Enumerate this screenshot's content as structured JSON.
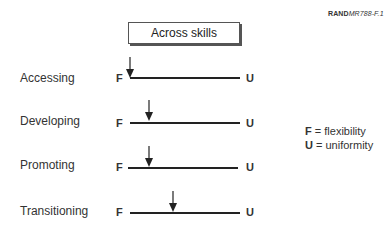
{
  "figure_id": {
    "prefix": "RAND",
    "suffix": "MR788-F.1"
  },
  "header": {
    "label": "Across skills"
  },
  "scale": {
    "left_label": "F",
    "right_label": "U"
  },
  "rows": [
    {
      "label": "Accessing",
      "position": 0.0
    },
    {
      "label": "Developing",
      "position": 0.18
    },
    {
      "label": "Promoting",
      "position": 0.19
    },
    {
      "label": "Transitioning",
      "position": 0.39
    }
  ],
  "legend": [
    {
      "key": "F",
      "text": " = flexibility"
    },
    {
      "key": "U",
      "text": " = uniformity"
    }
  ]
}
